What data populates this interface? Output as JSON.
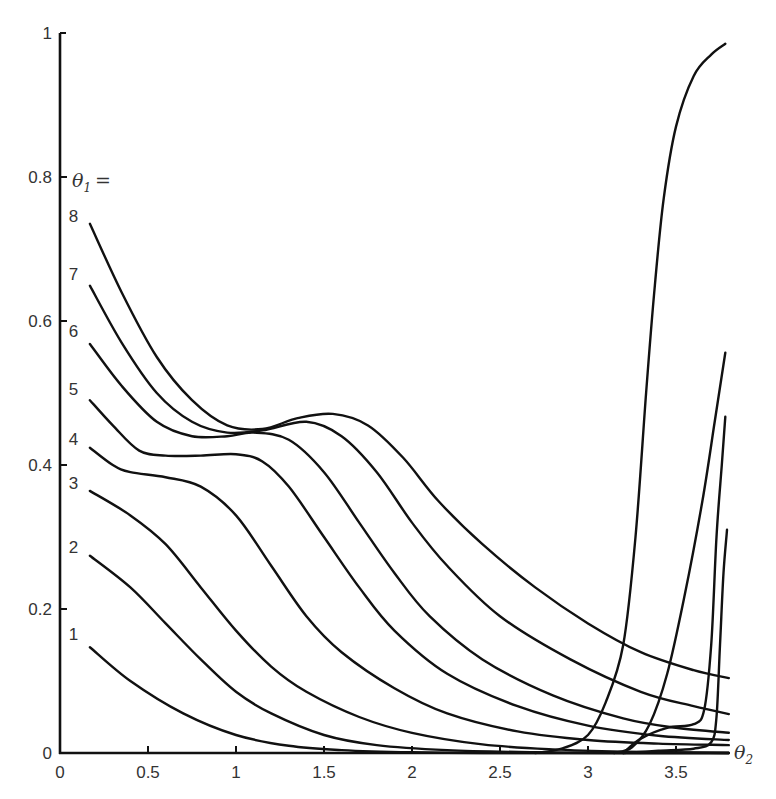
{
  "chart_data": {
    "type": "line",
    "title": "",
    "xlabel": "θ2",
    "ylabel": "",
    "legend_title": "θ1 =",
    "xlim": [
      0,
      3.85
    ],
    "ylim": [
      0,
      1
    ],
    "grid": false,
    "x_ticks": [
      0,
      0.5,
      1,
      1.5,
      2,
      2.5,
      3,
      3.5
    ],
    "x_tick_labels": [
      "0",
      "0.5",
      "1",
      "1.5",
      "2",
      "2.5",
      "3",
      "3.5"
    ],
    "y_ticks": [
      0,
      0.2,
      0.4,
      0.6,
      0.8,
      1
    ],
    "y_tick_labels": [
      "0",
      "0.2",
      "0.4",
      "0.6",
      "0.8",
      "1"
    ],
    "series": [
      {
        "name": "1",
        "label_pos": [
          0.1,
          0.16
        ],
        "points": [
          [
            0.17,
            0.147
          ],
          [
            0.4,
            0.1
          ],
          [
            0.7,
            0.055
          ],
          [
            1.0,
            0.025
          ],
          [
            1.3,
            0.01
          ],
          [
            1.6,
            0.004
          ],
          [
            2.0,
            0.001
          ],
          [
            2.5,
            0.0
          ],
          [
            3.0,
            0.0
          ],
          [
            3.8,
            0.0
          ]
        ]
      },
      {
        "name": "2",
        "label_pos": [
          0.1,
          0.28
        ],
        "points": [
          [
            0.17,
            0.274
          ],
          [
            0.4,
            0.23
          ],
          [
            0.6,
            0.18
          ],
          [
            0.8,
            0.13
          ],
          [
            1.0,
            0.085
          ],
          [
            1.2,
            0.055
          ],
          [
            1.5,
            0.025
          ],
          [
            1.8,
            0.011
          ],
          [
            2.2,
            0.004
          ],
          [
            2.7,
            0.001
          ],
          [
            3.2,
            0.0
          ],
          [
            3.8,
            0.0
          ]
        ]
      },
      {
        "name": "3",
        "label_pos": [
          0.1,
          0.37
        ],
        "points": [
          [
            0.17,
            0.364
          ],
          [
            0.4,
            0.33
          ],
          [
            0.6,
            0.29
          ],
          [
            0.8,
            0.23
          ],
          [
            1.0,
            0.17
          ],
          [
            1.2,
            0.12
          ],
          [
            1.4,
            0.085
          ],
          [
            1.7,
            0.05
          ],
          [
            2.0,
            0.028
          ],
          [
            2.4,
            0.012
          ],
          [
            2.8,
            0.005
          ],
          [
            3.2,
            0.002
          ],
          [
            3.8,
            0.0
          ]
        ]
      },
      {
        "name": "4",
        "label_pos": [
          0.1,
          0.43
        ],
        "points": [
          [
            0.17,
            0.424
          ],
          [
            0.3,
            0.4
          ],
          [
            0.4,
            0.39
          ],
          [
            0.6,
            0.383
          ],
          [
            0.8,
            0.37
          ],
          [
            1.0,
            0.33
          ],
          [
            1.2,
            0.26
          ],
          [
            1.4,
            0.19
          ],
          [
            1.6,
            0.14
          ],
          [
            1.9,
            0.09
          ],
          [
            2.2,
            0.055
          ],
          [
            2.6,
            0.03
          ],
          [
            3.0,
            0.018
          ],
          [
            3.4,
            0.013
          ],
          [
            3.8,
            0.011
          ]
        ]
      },
      {
        "name": "5",
        "label_pos": [
          0.1,
          0.5
        ],
        "points": [
          [
            0.17,
            0.49
          ],
          [
            0.3,
            0.455
          ],
          [
            0.45,
            0.42
          ],
          [
            0.6,
            0.413
          ],
          [
            0.8,
            0.413
          ],
          [
            1.0,
            0.415
          ],
          [
            1.15,
            0.405
          ],
          [
            1.3,
            0.37
          ],
          [
            1.5,
            0.3
          ],
          [
            1.7,
            0.23
          ],
          [
            1.9,
            0.17
          ],
          [
            2.2,
            0.11
          ],
          [
            2.6,
            0.065
          ],
          [
            3.0,
            0.038
          ],
          [
            3.4,
            0.024
          ],
          [
            3.8,
            0.018
          ]
        ]
      },
      {
        "name": "6",
        "label_pos": [
          0.1,
          0.58
        ],
        "points": [
          [
            0.17,
            0.568
          ],
          [
            0.35,
            0.51
          ],
          [
            0.55,
            0.46
          ],
          [
            0.75,
            0.44
          ],
          [
            0.95,
            0.44
          ],
          [
            1.1,
            0.445
          ],
          [
            1.3,
            0.435
          ],
          [
            1.5,
            0.39
          ],
          [
            1.7,
            0.32
          ],
          [
            1.9,
            0.25
          ],
          [
            2.1,
            0.19
          ],
          [
            2.4,
            0.13
          ],
          [
            2.8,
            0.08
          ],
          [
            3.2,
            0.048
          ],
          [
            3.5,
            0.035
          ],
          [
            3.8,
            0.028
          ]
        ]
      },
      {
        "name": "7",
        "label_pos": [
          0.1,
          0.66
        ],
        "points": [
          [
            0.17,
            0.649
          ],
          [
            0.35,
            0.57
          ],
          [
            0.55,
            0.5
          ],
          [
            0.75,
            0.46
          ],
          [
            0.95,
            0.445
          ],
          [
            1.15,
            0.448
          ],
          [
            1.4,
            0.46
          ],
          [
            1.6,
            0.44
          ],
          [
            1.8,
            0.39
          ],
          [
            2.0,
            0.32
          ],
          [
            2.2,
            0.26
          ],
          [
            2.5,
            0.19
          ],
          [
            2.9,
            0.13
          ],
          [
            3.3,
            0.085
          ],
          [
            3.6,
            0.065
          ],
          [
            3.8,
            0.054
          ]
        ]
      },
      {
        "name": "8",
        "label_pos": [
          0.1,
          0.74
        ],
        "points": [
          [
            0.17,
            0.735
          ],
          [
            0.35,
            0.64
          ],
          [
            0.55,
            0.55
          ],
          [
            0.75,
            0.49
          ],
          [
            0.95,
            0.455
          ],
          [
            1.15,
            0.45
          ],
          [
            1.35,
            0.465
          ],
          [
            1.55,
            0.471
          ],
          [
            1.75,
            0.455
          ],
          [
            1.95,
            0.41
          ],
          [
            2.15,
            0.35
          ],
          [
            2.4,
            0.29
          ],
          [
            2.7,
            0.23
          ],
          [
            3.0,
            0.18
          ],
          [
            3.3,
            0.14
          ],
          [
            3.6,
            0.115
          ],
          [
            3.8,
            0.104
          ]
        ]
      },
      {
        "name": "rise-a",
        "points": [
          [
            2.7,
            0.0
          ],
          [
            2.85,
            0.006
          ],
          [
            3.0,
            0.025
          ],
          [
            3.1,
            0.07
          ],
          [
            3.2,
            0.15
          ],
          [
            3.27,
            0.3
          ],
          [
            3.33,
            0.5
          ],
          [
            3.38,
            0.65
          ],
          [
            3.43,
            0.77
          ],
          [
            3.5,
            0.87
          ],
          [
            3.6,
            0.94
          ],
          [
            3.7,
            0.97
          ],
          [
            3.78,
            0.985
          ]
        ]
      },
      {
        "name": "rise-b",
        "points": [
          [
            3.15,
            0.0
          ],
          [
            3.25,
            0.008
          ],
          [
            3.35,
            0.04
          ],
          [
            3.45,
            0.11
          ],
          [
            3.55,
            0.22
          ],
          [
            3.65,
            0.35
          ],
          [
            3.72,
            0.46
          ],
          [
            3.78,
            0.556
          ]
        ]
      },
      {
        "name": "rise-c",
        "points": [
          [
            3.2,
            0.0
          ],
          [
            3.3,
            0.02
          ],
          [
            3.45,
            0.035
          ],
          [
            3.6,
            0.04
          ],
          [
            3.66,
            0.06
          ],
          [
            3.7,
            0.15
          ],
          [
            3.73,
            0.3
          ],
          [
            3.76,
            0.4
          ],
          [
            3.78,
            0.467
          ]
        ]
      },
      {
        "name": "rise-d",
        "points": [
          [
            3.2,
            0.0
          ],
          [
            3.4,
            0.003
          ],
          [
            3.6,
            0.006
          ],
          [
            3.7,
            0.015
          ],
          [
            3.73,
            0.05
          ],
          [
            3.75,
            0.15
          ],
          [
            3.77,
            0.25
          ],
          [
            3.79,
            0.31
          ]
        ]
      }
    ]
  }
}
